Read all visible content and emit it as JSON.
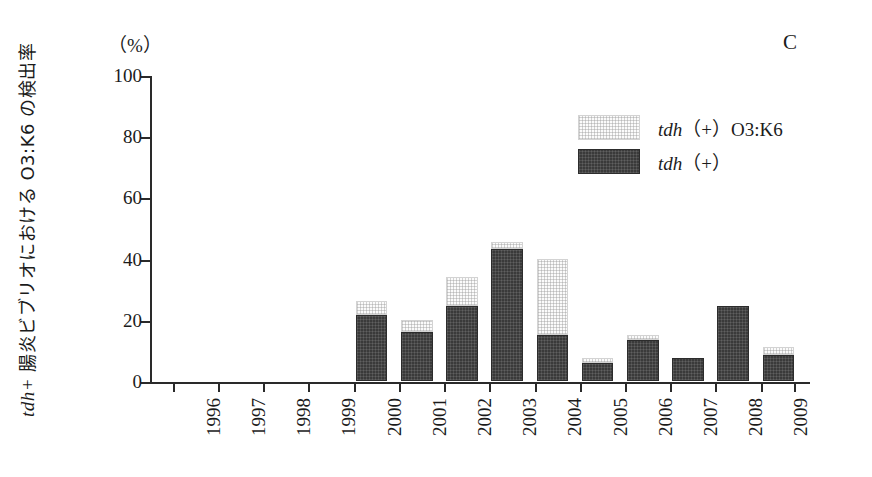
{
  "panel_letter": "C",
  "unit_label": "（%）",
  "y_axis_title_italic": "tdh+",
  "y_axis_title_jp": " 腸炎ビブリオにおける O3:K6 の検出率",
  "legend": {
    "position": "upper-right",
    "items": [
      {
        "label_italic": "tdh",
        "label_rest": "（+）O3:K6",
        "swatch": "light-dotted",
        "color": "#fbfbfb"
      },
      {
        "label_italic": "tdh",
        "label_rest": "（+）",
        "swatch": "dark-dotted",
        "color": "#3a3a3a"
      }
    ]
  },
  "colors": {
    "dark_series": "#3a3a3a",
    "light_series": "#fbfbfb",
    "axis": "#2a2a2a",
    "text": "#1b1b1b",
    "background": "#ffffff"
  },
  "chart_data": {
    "type": "bar",
    "subtype": "stacked",
    "title": "C",
    "xlabel": "",
    "ylabel": "tdh+ 腸炎ビブリオにおける O3:K6 の検出率 (%)",
    "ylim": [
      0,
      100
    ],
    "yticks": [
      0,
      20,
      40,
      60,
      80,
      100
    ],
    "ytick_labels": [
      "0",
      "20",
      "40",
      "60",
      "80",
      "100"
    ],
    "grid": false,
    "legend_position": "upper right",
    "categories": [
      "1996",
      "1997",
      "1998",
      "1999",
      "2000",
      "2001",
      "2002",
      "2003",
      "2004",
      "2005",
      "2006",
      "2007",
      "2008",
      "2009"
    ],
    "series": [
      {
        "name": "tdh (+)",
        "swatch": "dark",
        "values": [
          0,
          0,
          0,
          0,
          21.5,
          16.0,
          24.5,
          43.0,
          15.0,
          6.0,
          13.5,
          7.5,
          24.5,
          8.5
        ]
      },
      {
        "name": "tdh (+) O3:K6",
        "swatch": "light",
        "values": [
          0,
          0,
          0,
          0,
          4.5,
          4.0,
          9.5,
          2.5,
          25.0,
          1.5,
          1.5,
          0,
          0,
          2.5
        ]
      }
    ],
    "totals": [
      0,
      0,
      0,
      0,
      26.0,
      20.0,
      34.0,
      45.5,
      40.0,
      7.5,
      15.0,
      7.5,
      24.5,
      11.0
    ]
  }
}
